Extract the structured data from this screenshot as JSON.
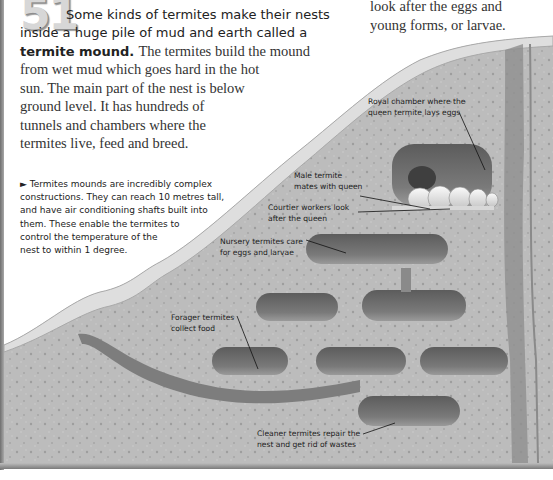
{
  "fact": {
    "number": "51",
    "intro_lead": "Some kinds of termites make their nests inside a huge pile of mud and earth called a",
    "intro_bold": "termite mound.",
    "body_lines": [
      "The termites build the mound",
      "from wet mud which goes hard in the hot",
      "sun. The main part of the nest is below",
      "ground level. It has hundreds of",
      "tunnels and chambers where the",
      "termites live, feed and breed."
    ],
    "continued_text_lines": [
      "look after the eggs and",
      "young forms, or larvae."
    ]
  },
  "caption": {
    "marker": "►",
    "lines": [
      "Termites mounds are incredibly complex",
      "constructions. They can reach 10 metres tall,",
      "and have air conditioning shafts built into",
      "them. These enable the termites to",
      "control the temperature of the",
      "nest to within 1 degree."
    ]
  },
  "illustration": {
    "title": "Termite mound cross-section",
    "labels": {
      "royal_chamber": [
        "Royal chamber where the",
        "queen termite lays eggs"
      ],
      "male_termite": [
        "Male termite",
        "mates with queen"
      ],
      "courtier": [
        "Courtier workers look",
        "after the queen"
      ],
      "nursery": [
        "Nursery termites care",
        "for eggs and larvae"
      ],
      "forager": [
        "Forager termites",
        "collect food"
      ],
      "cleaner": [
        "Cleaner termites repair the",
        "nest and get rid of wastes"
      ]
    }
  },
  "colors": {
    "mound_fill": "#b9b9b9",
    "mound_surface": "#d9d9d9",
    "chamber": "#6f6f6f",
    "queen": "#ececec",
    "text": "#222222"
  }
}
